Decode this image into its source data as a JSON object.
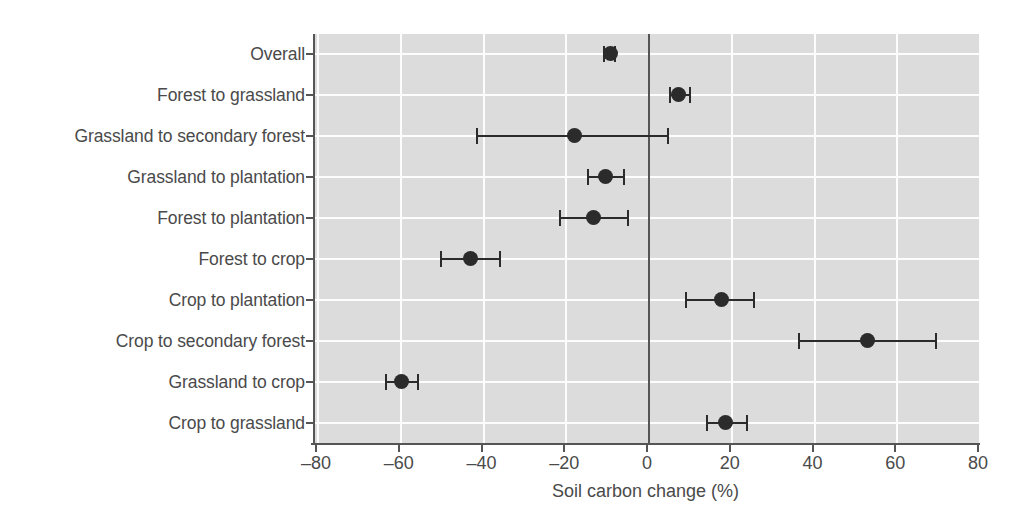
{
  "chart_data": {
    "type": "scatter",
    "title": "",
    "xlabel": "Soil carbon change (%)",
    "ylabel": "",
    "xlim": [
      -80,
      80
    ],
    "xticks": [
      -80,
      -60,
      -40,
      -20,
      0,
      20,
      40,
      60,
      80
    ],
    "xticklabels": [
      "‒80",
      "‒60",
      "‒40",
      "‒20",
      "0",
      "20",
      "40",
      "60",
      "80"
    ],
    "grid": true,
    "legend": null,
    "reference_line": 0,
    "categories": [
      "Overall",
      "Forest to grassland",
      "Grassland to secondary forest",
      "Grassland to plantation",
      "Forest to plantation",
      "Forest to crop",
      "Crop to plantation",
      "Crop to secondary forest",
      "Grassland to crop",
      "Crop to grassland"
    ],
    "values": [
      -9.4,
      7.2,
      -17.9,
      -10.6,
      -13.3,
      -43.2,
      17.6,
      52.9,
      -59.9,
      18.4
    ],
    "ci_low": [
      -11.1,
      4.8,
      -41.8,
      -15.0,
      -21.7,
      -50.5,
      8.7,
      36.0,
      -63.8,
      13.8
    ],
    "ci_high": [
      -8.0,
      10.1,
      4.8,
      -5.8,
      -4.8,
      -35.7,
      25.6,
      69.6,
      -55.6,
      23.9
    ],
    "points": [
      {
        "label": "Overall",
        "value": -9.4,
        "ci_low": -11.1,
        "ci_high": -8.0
      },
      {
        "label": "Forest to grassland",
        "value": 7.2,
        "ci_low": 4.8,
        "ci_high": 10.1
      },
      {
        "label": "Grassland to secondary forest",
        "value": -17.9,
        "ci_low": -41.8,
        "ci_high": 4.8
      },
      {
        "label": "Grassland to plantation",
        "value": -10.6,
        "ci_low": -15.0,
        "ci_high": -5.8
      },
      {
        "label": "Forest to plantation",
        "value": -13.3,
        "ci_low": -21.7,
        "ci_high": -4.8
      },
      {
        "label": "Forest to crop",
        "value": -43.2,
        "ci_low": -50.5,
        "ci_high": -35.7
      },
      {
        "label": "Crop to plantation",
        "value": 17.6,
        "ci_low": 8.7,
        "ci_high": 25.6
      },
      {
        "label": "Crop to secondary forest",
        "value": 52.9,
        "ci_low": 36.0,
        "ci_high": 69.6
      },
      {
        "label": "Grassland to crop",
        "value": -59.9,
        "ci_low": -63.8,
        "ci_high": -55.6
      },
      {
        "label": "Crop to grassland",
        "value": 18.4,
        "ci_low": 13.8,
        "ci_high": 23.9
      }
    ]
  },
  "colors": {
    "panel_background": "#dcdcdc",
    "gridline": "#fdfdfd",
    "marker": "#2b2b2b",
    "axis": "#555555",
    "text": "#4a4a4a",
    "page_background": "#ffffff"
  }
}
